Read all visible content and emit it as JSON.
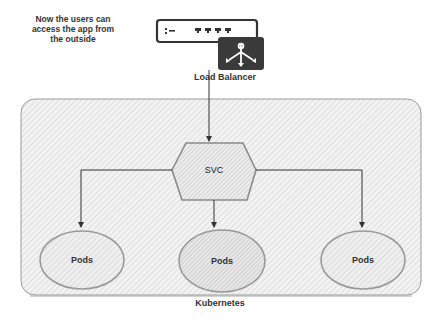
{
  "annotation": {
    "note_line1": "Now the users can",
    "note_line2": "access the app from",
    "note_line3": "the outside"
  },
  "load_balancer": {
    "label": "Load Balancer",
    "icon": "load-balancer-icon"
  },
  "service": {
    "label": "SVC",
    "shape": "hexagon"
  },
  "pods": [
    {
      "label": "Pods"
    },
    {
      "label": "Pods"
    },
    {
      "label": "Pods"
    }
  ],
  "cluster": {
    "label": "Kubernetes"
  },
  "colors": {
    "stroke": "#555555",
    "hatch": "#bdbdbd",
    "lb_dark": "#3a3a3a",
    "background": "#ffffff"
  }
}
